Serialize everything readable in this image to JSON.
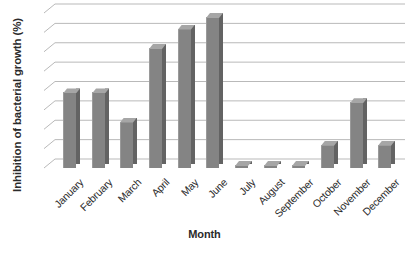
{
  "chart_data": {
    "type": "bar",
    "title": "",
    "xlabel": "Month",
    "ylabel": "Inhibition of bacterial growth (%)",
    "categories": [
      "January",
      "February",
      "March",
      "April",
      "May",
      "June",
      "July",
      "August",
      "September",
      "October",
      "November",
      "December"
    ],
    "values": [
      39,
      39,
      24,
      62,
      72,
      78,
      1.5,
      1.5,
      1.5,
      12,
      34,
      12
    ],
    "ylim": [
      0,
      80
    ],
    "y_gridline_values": [
      10,
      20,
      30,
      40,
      50,
      60,
      70,
      80
    ],
    "y_tick_labels_shown": false,
    "grid": true,
    "legend": false,
    "style": "3d-column",
    "bar_color": "#848484",
    "bar_side_color": "#636363",
    "bar_top_color": "#a6a6a6",
    "gridline_color": "#b9b9b9",
    "background_color": "#ffffff",
    "text_color": "#2b2b2b",
    "x_label_rotation_deg": -45
  }
}
